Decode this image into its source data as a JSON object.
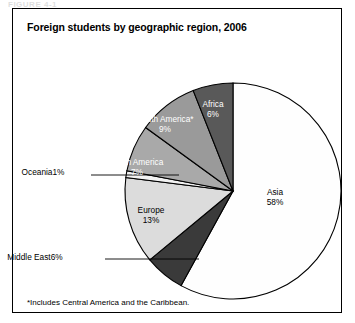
{
  "figure": {
    "top_artifact": "FIGURE 4-1",
    "title": "Foreign students by geographic region, 2006",
    "footnote": "*Includes Central America and the Caribbean."
  },
  "chart_data": {
    "type": "pie",
    "title": "Foreign students by geographic region, 2006",
    "unit": "percent",
    "start_angle_deg": 0,
    "direction": "clockwise",
    "legend": "none (labels on slices and callouts)",
    "total": 100,
    "categories": [
      "Asia",
      "Middle East",
      "Europe",
      "Oceania",
      "North America",
      "South America*",
      "Africa"
    ],
    "values": [
      58,
      6,
      13,
      1,
      7,
      9,
      6
    ],
    "slices": [
      {
        "label": "Asia",
        "pct_text": "58%",
        "value": 58,
        "color": "#fefefe",
        "label_style": "inside-dark-text",
        "label_x": 262,
        "label_y": 178
      },
      {
        "label": "Middle East",
        "pct_text": "6%",
        "value": 6,
        "color": "#3a3a3a",
        "label_style": "callout-left",
        "label_x": 22,
        "label_y": 243,
        "leader_from_x": 92,
        "leader_to_x": 186,
        "leader_y": 250
      },
      {
        "label": "Europe",
        "pct_text": "13%",
        "value": 13,
        "color": "#dcdcdc",
        "label_style": "inside-dark-text",
        "label_x": 138,
        "label_y": 196
      },
      {
        "label": "Oceania",
        "pct_text": "1%",
        "value": 1,
        "color": "#f2f2f2",
        "label_style": "callout-left",
        "label_x": 30,
        "label_y": 158,
        "leader_from_x": 78,
        "leader_to_x": 166,
        "leader_y": 166
      },
      {
        "label": "North America",
        "pct_text": "7%",
        "value": 7,
        "color": "#a9a9a9",
        "label_style": "inside-light-text",
        "label_x": 124,
        "label_y": 148
      },
      {
        "label": "South America*",
        "pct_text": "9%",
        "value": 9,
        "color": "#9a9a9a",
        "label_style": "inside-light-text",
        "label_x": 152,
        "label_y": 105
      },
      {
        "label": "Africa",
        "pct_text": "6%",
        "value": 6,
        "color": "#595959",
        "label_style": "inside-light-text",
        "label_x": 200,
        "label_y": 90
      }
    ],
    "geometry": {
      "center_x": 220,
      "center_y": 182,
      "radius": 108
    },
    "colors": {
      "outline": "#000000",
      "frame": "#000000",
      "background": "#ffffff"
    }
  }
}
